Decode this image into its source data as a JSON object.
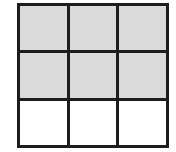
{
  "figure": {
    "name": "three-by-three-grid",
    "kind": "grid-diagram",
    "rows": 3,
    "columns": 3,
    "canvas": {
      "width": 176,
      "height": 152,
      "background": "#ffffff"
    },
    "frame": {
      "x": 17,
      "y": 3,
      "width": 152,
      "height": 145
    },
    "line_color": "#1d1d1d",
    "line_width_px": 3,
    "fill_colors": {
      "gray": "#a9a9a9",
      "white": "#ffffff"
    },
    "fill_style": "halftone-checkerboard",
    "filled_count": 6,
    "empty_count": 3
  },
  "cells": [
    [
      {
        "id": "r1c1",
        "fill": "gray",
        "label": ""
      },
      {
        "id": "r1c2",
        "fill": "gray",
        "label": ""
      },
      {
        "id": "r1c3",
        "fill": "gray",
        "label": ""
      }
    ],
    [
      {
        "id": "r2c1",
        "fill": "gray",
        "label": ""
      },
      {
        "id": "r2c2",
        "fill": "gray",
        "label": ""
      },
      {
        "id": "r2c3",
        "fill": "gray",
        "label": ""
      }
    ],
    [
      {
        "id": "r3c1",
        "fill": "white",
        "label": ""
      },
      {
        "id": "r3c2",
        "fill": "white",
        "label": ""
      },
      {
        "id": "r3c3",
        "fill": "white",
        "label": ""
      }
    ]
  ]
}
